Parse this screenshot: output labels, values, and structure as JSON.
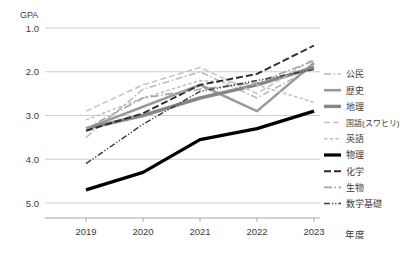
{
  "chart_data": {
    "type": "line",
    "title": "",
    "xlabel": "年度",
    "ylabel": "GPA",
    "categories": [
      "2019",
      "2020",
      "2021",
      "2022",
      "2023"
    ],
    "x": [
      2019,
      2020,
      2021,
      2022,
      2023
    ],
    "ylim": [
      1.0,
      5.0
    ],
    "y_inverted": true,
    "y_ticks": [
      "1.0",
      "2.0",
      "3.0",
      "4.0",
      "5.0"
    ],
    "y_tick_values": [
      1.0,
      2.0,
      3.0,
      4.0,
      5.0
    ],
    "grid": "horizontal",
    "legend_position": "right",
    "series": [
      {
        "name": "公民",
        "values": [
          3.5,
          2.4,
          2.0,
          2.6,
          1.9
        ],
        "color": "#b9b9b9",
        "width": 1.6,
        "dash": "7,2.5,1.6,2.5"
      },
      {
        "name": "歴史",
        "values": [
          3.3,
          2.8,
          2.3,
          2.9,
          1.8
        ],
        "color": "#9a9a9a",
        "width": 2.6,
        "dash": "none"
      },
      {
        "name": "地理",
        "values": [
          3.3,
          3.0,
          2.6,
          2.3,
          1.9
        ],
        "color": "#878787",
        "width": 3.4,
        "dash": "none"
      },
      {
        "name": "国語(スワヒリ)",
        "values": [
          2.9,
          2.3,
          1.9,
          2.5,
          1.7
        ],
        "color": "#c2c2c2",
        "width": 1.5,
        "dash": "6,3"
      },
      {
        "name": "英語",
        "values": [
          3.1,
          2.6,
          2.2,
          2.3,
          2.7
        ],
        "color": "#bdbdbd",
        "width": 1.4,
        "dash": "3.5,2.2"
      },
      {
        "name": "物理",
        "values": [
          4.7,
          4.3,
          3.55,
          3.3,
          2.9
        ],
        "color": "#000000",
        "width": 3.2,
        "dash": "none"
      },
      {
        "name": "化学",
        "values": [
          3.35,
          2.95,
          2.3,
          2.05,
          1.4
        ],
        "color": "#2b2b2b",
        "width": 1.9,
        "dash": "7,3"
      },
      {
        "name": "生物",
        "values": [
          3.3,
          2.6,
          2.4,
          2.25,
          1.75
        ],
        "color": "#a5a5a5",
        "width": 1.6,
        "dash": "8,2.5,1.5,2.5"
      },
      {
        "name": "数学基礎",
        "values": [
          4.1,
          3.2,
          2.45,
          2.2,
          1.95
        ],
        "color": "#3d3d3d",
        "width": 1.5,
        "dash": "6,2,1.2,2,1.2,2"
      }
    ]
  },
  "legend": {
    "items": [
      {
        "label": "公民"
      },
      {
        "label": "歴史"
      },
      {
        "label": "地理"
      },
      {
        "label": "国語(スワヒリ)"
      },
      {
        "label": "英語"
      },
      {
        "label": "物理"
      },
      {
        "label": "化学"
      },
      {
        "label": "生物"
      },
      {
        "label": "数学基礎"
      }
    ]
  },
  "axes": {
    "y_unit_label": "GPA",
    "x_unit_label": "年度"
  },
  "colors": {
    "axis": "#9b9b9b",
    "grid": "#c8c8c8",
    "text": "#3a3a3a",
    "background": "#ffffff"
  }
}
